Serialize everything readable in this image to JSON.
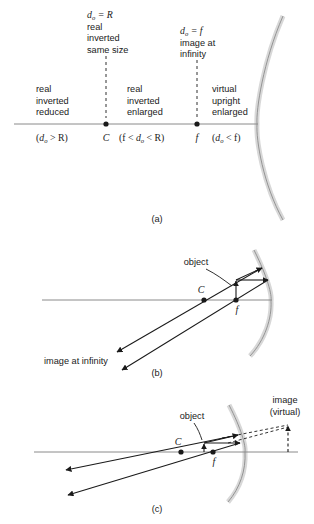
{
  "figure": {
    "colors": {
      "ink": "#1a1a1a",
      "axis": "#8a8a8a",
      "mirror_fill": "#d8d8d8",
      "mirror_stroke": "#8c8c8c",
      "background": "#ffffff"
    }
  },
  "panels": [
    {
      "id": "a",
      "caption": "(a)",
      "markers": [
        {
          "name": "center-of-curvature",
          "label": "C"
        },
        {
          "name": "focal-point",
          "label": "f"
        }
      ],
      "callouts": [
        {
          "name": "at-center-of-curvature",
          "condition": "d",
          "condition_sub": "o",
          "condition_rest": " = R",
          "lines": [
            "real",
            "inverted",
            "same size"
          ]
        },
        {
          "name": "at-focal-point",
          "condition": "d",
          "condition_sub": "o",
          "condition_rest": " = f",
          "lines": [
            "image at",
            "infinity"
          ]
        }
      ],
      "regions": [
        {
          "name": "beyond-center-of-curvature",
          "lines": [
            "real",
            "inverted",
            "reduced"
          ],
          "range_open": "(",
          "range_var": "d",
          "range_sub": "o",
          "range_rest": " > R)"
        },
        {
          "name": "between-focus-and-center",
          "lines": [
            "real",
            "inverted",
            "enlarged"
          ],
          "range_open": "(f < ",
          "range_var": "d",
          "range_sub": "o",
          "range_rest": " < R)"
        },
        {
          "name": "inside-focal-point",
          "lines": [
            "virtual",
            "upright",
            "enlarged"
          ],
          "range_open": "(",
          "range_var": "d",
          "range_sub": "o",
          "range_rest": " < f)"
        }
      ]
    },
    {
      "id": "b",
      "caption": "(b)",
      "object_label": "object",
      "image_label": "image at infinity",
      "markers": [
        {
          "name": "center-of-curvature",
          "label": "C"
        },
        {
          "name": "focal-point",
          "label": "f"
        }
      ]
    },
    {
      "id": "c",
      "caption": "(c)",
      "object_label": "object",
      "image_label_line1": "image",
      "image_label_line2": "(virtual)",
      "markers": [
        {
          "name": "center-of-curvature",
          "label": "C"
        },
        {
          "name": "focal-point",
          "label": "f"
        }
      ]
    }
  ]
}
